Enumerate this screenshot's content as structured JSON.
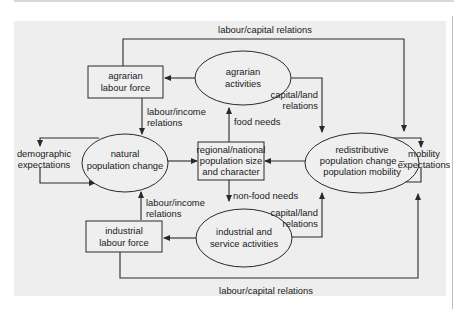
{
  "nodes": {
    "agrarian_labour_force": {
      "shape": "box",
      "lines": [
        "agrarian",
        "labour force"
      ]
    },
    "agrarian_activities": {
      "shape": "ellipse",
      "lines": [
        "agrarian",
        "activities"
      ]
    },
    "natural_population_change": {
      "shape": "ellipse",
      "lines": [
        "natural",
        "population change"
      ]
    },
    "regional_national": {
      "shape": "box",
      "lines": [
        "regional/national",
        "population size",
        "and character"
      ]
    },
    "redistributive": {
      "shape": "ellipse",
      "lines": [
        "redistributive",
        "population change –",
        "population mobility"
      ]
    },
    "industrial_labour_force": {
      "shape": "box",
      "lines": [
        "industrial",
        "labour force"
      ]
    },
    "industrial_service_activities": {
      "shape": "ellipse",
      "lines": [
        "industrial and",
        "service activities"
      ]
    },
    "demographic_expectations": {
      "shape": "text",
      "lines": [
        "demographic",
        "expectations"
      ]
    },
    "mobility_expectations": {
      "shape": "text",
      "lines": [
        "mobility",
        "expectations"
      ]
    }
  },
  "edge_labels": {
    "top_labour_capital": "labour/capital relations",
    "bottom_labour_capital": "labour/capital relations",
    "upper_labour_income": [
      "labour/income",
      "relations"
    ],
    "lower_labour_income": [
      "labour/income",
      "relations"
    ],
    "upper_capital_land": [
      "capital/land",
      "relations"
    ],
    "lower_capital_land": [
      "capital/land",
      "relations"
    ],
    "food_needs": "food needs",
    "non_food_needs": "non-food needs"
  },
  "colors": {
    "panel_background": "#eeeeee",
    "stroke": "#2a2a2a",
    "text": "#1a1a1a"
  }
}
